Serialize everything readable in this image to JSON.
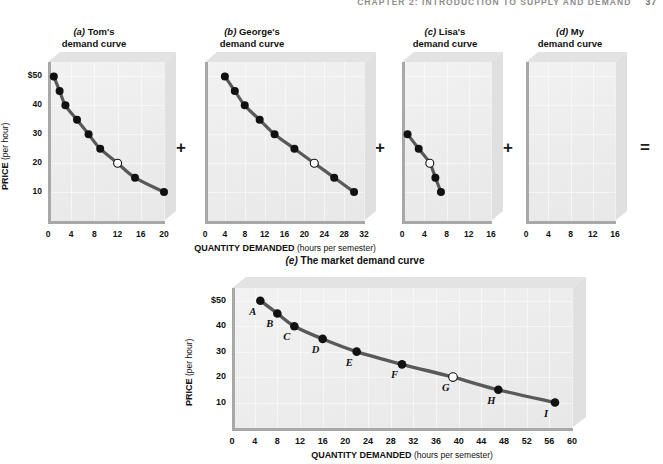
{
  "running_head": {
    "text": "CHAPTER 2: INTRODUCTION TO SUPPLY AND DEMAND",
    "page": "37"
  },
  "operators": {
    "plus": "+",
    "equals": "="
  },
  "panels": [
    {
      "key": "a",
      "tag": "(a)",
      "name": "Tom's",
      "sub": "demand curve"
    },
    {
      "key": "b",
      "tag": "(b)",
      "name": "George's",
      "sub": "demand curve"
    },
    {
      "key": "c",
      "tag": "(c)",
      "name": "Lisa's",
      "sub": "demand curve"
    },
    {
      "key": "d",
      "tag": "(d)",
      "name": "My",
      "sub": "demand curve"
    }
  ],
  "market_title": {
    "tag": "(e)",
    "text": "The market demand curve"
  },
  "axes": {
    "ylabel_bold": "PRICE",
    "ylabel_unit": "(per hour)",
    "xlabel_bold": "QUANTITY DEMANDED",
    "xlabel_unit": "(hours per semester)",
    "yticks": [
      "$50",
      "40",
      "30",
      "20",
      "10"
    ]
  },
  "chart_data": [
    {
      "id": "tom",
      "type": "line",
      "title": "(a) Tom's demand curve",
      "xlabel": "QUANTITY DEMANDED (hours per semester)",
      "ylabel": "PRICE (per hour)",
      "xlim": [
        0,
        20
      ],
      "ylim": [
        0,
        55
      ],
      "xticks": [
        0,
        4,
        8,
        12,
        16,
        20
      ],
      "yticks": [
        10,
        20,
        30,
        40,
        50
      ],
      "ytick_labels": [
        "10",
        "20",
        "30",
        "40",
        "$50"
      ],
      "grid": true,
      "legend": "none",
      "x": [
        1,
        2,
        3,
        5,
        7,
        9,
        12,
        15,
        20
      ],
      "y": [
        50,
        45,
        40,
        35,
        30,
        25,
        20,
        15,
        10
      ],
      "open_marker_index": 6
    },
    {
      "id": "george",
      "type": "line",
      "title": "(b) George's demand curve",
      "xlabel": "QUANTITY DEMANDED (hours per semester)",
      "ylabel": "PRICE (per hour)",
      "xlim": [
        0,
        32
      ],
      "ylim": [
        0,
        55
      ],
      "xticks": [
        0,
        4,
        8,
        12,
        16,
        20,
        24,
        28,
        32
      ],
      "yticks": [
        10,
        20,
        30,
        40,
        50
      ],
      "grid": true,
      "legend": "none",
      "x": [
        4,
        6,
        8,
        11,
        14,
        18,
        22,
        26,
        30
      ],
      "y": [
        50,
        45,
        40,
        35,
        30,
        25,
        20,
        15,
        10
      ],
      "open_marker_index": 6
    },
    {
      "id": "lisa",
      "type": "line",
      "title": "(c) Lisa's demand curve",
      "xlabel": "QUANTITY DEMANDED (hours per semester)",
      "ylabel": "PRICE (per hour)",
      "xlim": [
        0,
        16
      ],
      "ylim": [
        0,
        55
      ],
      "xticks": [
        0,
        4,
        8,
        12,
        16
      ],
      "yticks": [
        10,
        20,
        30,
        40,
        50
      ],
      "grid": true,
      "legend": "none",
      "x": [
        1,
        3,
        5,
        6,
        7
      ],
      "y": [
        30,
        25,
        20,
        15,
        10
      ],
      "open_marker_index": 2
    },
    {
      "id": "my",
      "type": "line",
      "title": "(d) My demand curve",
      "xlabel": "QUANTITY DEMANDED (hours per semester)",
      "ylabel": "PRICE (per hour)",
      "xlim": [
        0,
        16
      ],
      "ylim": [
        0,
        55
      ],
      "xticks": [
        0,
        4,
        8,
        12,
        16
      ],
      "yticks": [
        10,
        20,
        30,
        40,
        50
      ],
      "grid": true,
      "legend": "none",
      "x": [],
      "y": [],
      "open_marker_index": -1
    },
    {
      "id": "market",
      "type": "line",
      "title": "(e) The market demand curve",
      "xlabel": "QUANTITY DEMANDED (hours per semester)",
      "ylabel": "PRICE (per hour)",
      "xlim": [
        0,
        60
      ],
      "ylim": [
        0,
        55
      ],
      "xticks": [
        0,
        4,
        8,
        12,
        16,
        20,
        24,
        28,
        32,
        36,
        40,
        44,
        48,
        52,
        56,
        60
      ],
      "yticks": [
        10,
        20,
        30,
        40,
        50
      ],
      "ytick_labels": [
        "10",
        "20",
        "30",
        "40",
        "$50"
      ],
      "grid": true,
      "legend": "none",
      "x": [
        5,
        8,
        11,
        16,
        22,
        30,
        39,
        47,
        57
      ],
      "y": [
        50,
        45,
        40,
        35,
        30,
        25,
        20,
        15,
        10
      ],
      "point_labels": [
        "A",
        "B",
        "C",
        "D",
        "E",
        "F",
        "G",
        "H",
        "I"
      ],
      "open_marker_index": 6
    }
  ],
  "colors": {
    "curve": "#595959",
    "marker_fill": "#111111",
    "marker_open_fill": "#ffffff",
    "plot_bg": "#ededed",
    "box_top": "#e3e3e3",
    "box_right": "#e0e0e0",
    "axis": "#a8a8a8",
    "grid": "#ffffff",
    "text": "#111111"
  }
}
